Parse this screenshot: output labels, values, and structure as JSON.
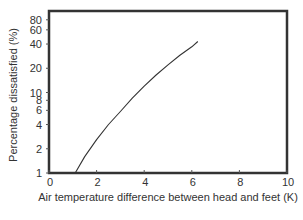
{
  "chart_data": {
    "type": "line",
    "title": "",
    "xlabel": "Air temperature difference between head and feet (K)",
    "ylabel": "Percentage dissatisfied (%)",
    "xlim": [
      0,
      10
    ],
    "ylim": [
      1,
      100
    ],
    "yscale": "log",
    "grid": false,
    "legend": null,
    "x_ticks": [
      0,
      2,
      4,
      6,
      8,
      10
    ],
    "x_tick_labels": [
      "0",
      "2",
      "4",
      "6",
      "8",
      "10"
    ],
    "y_ticks": [
      1,
      2,
      4,
      6,
      8,
      10,
      20,
      40,
      60,
      80
    ],
    "y_tick_labels": [
      "1",
      "2",
      "4",
      "6",
      "8",
      "10",
      "20",
      "40",
      "60",
      "80"
    ],
    "series": [
      {
        "name": "Percentage dissatisfied",
        "color": "#333333",
        "x": [
          1.1,
          1.5,
          2.0,
          2.5,
          3.0,
          3.5,
          4.0,
          4.5,
          5.0,
          5.5,
          6.0,
          6.25
        ],
        "y": [
          1.0,
          1.6,
          2.6,
          4.0,
          5.8,
          8.5,
          12.0,
          16.5,
          22.0,
          29.0,
          37.0,
          43.0
        ]
      }
    ]
  },
  "labels": {
    "xlabel": "Air temperature difference between head and feet (K)",
    "ylabel": "Percentage dissatisfied (%)"
  }
}
